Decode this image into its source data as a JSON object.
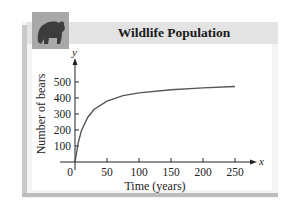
{
  "header": {
    "title": "Wildlife Population",
    "image": "bear-photo"
  },
  "axes": {
    "y_symbol": "y",
    "x_symbol": "x",
    "ylabel": "Number of bears",
    "xlabel": "Time (years)",
    "y_ticks": [
      "100",
      "200",
      "300",
      "400",
      "500"
    ],
    "x_ticks": [
      "0",
      "50",
      "100",
      "150",
      "200",
      "250"
    ]
  },
  "chart_data": {
    "type": "line",
    "title": "Wildlife Population",
    "xlabel": "Time (years)",
    "ylabel": "Number of bears",
    "x": [
      0,
      5,
      10,
      20,
      30,
      50,
      75,
      100,
      150,
      200,
      250
    ],
    "values": [
      0,
      120,
      195,
      280,
      330,
      380,
      415,
      432,
      452,
      463,
      472
    ],
    "xlim": [
      0,
      270
    ],
    "ylim": [
      0,
      550
    ],
    "x_ticks": [
      50,
      100,
      150,
      200,
      250
    ],
    "y_ticks": [
      100,
      200,
      300,
      400,
      500
    ],
    "grid": false,
    "legend": null
  },
  "colors": {
    "curve": "#555555",
    "header": "#e3e3e3",
    "panel": "#f4f4f4"
  }
}
